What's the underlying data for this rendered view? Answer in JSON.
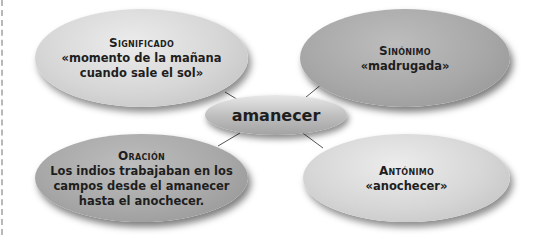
{
  "diagram": {
    "center": {
      "label": "amanecer"
    },
    "nodes": [
      {
        "id": "significado",
        "heading": "Significado",
        "lines": [
          "«momento de la mañana",
          "cuando sale el sol»"
        ]
      },
      {
        "id": "sinonimo",
        "heading": "Sinónimo",
        "lines": [
          "«madrugada»"
        ]
      },
      {
        "id": "oracion",
        "heading": "Oración",
        "lines": [
          "Los indios trabajaban en los",
          "campos desde el amanecer",
          "hasta el anochecer."
        ]
      },
      {
        "id": "antonimo",
        "heading": "Antónimo",
        "lines": [
          "«anochecer»"
        ]
      }
    ],
    "colors": {
      "light_node": "#d6d6d6",
      "dark_node": "#a8a8a8",
      "connector": "#555555"
    }
  }
}
